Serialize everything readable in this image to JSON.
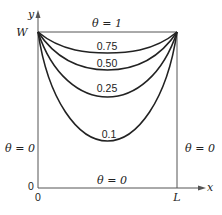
{
  "diagram": {
    "axes": {
      "x_label": "x",
      "y_label": "y",
      "origin_x_label": "0",
      "origin_y_label": "0",
      "x_end_label": "L",
      "y_top_label": "W"
    },
    "boundary_conditions": {
      "top": "θ = 1",
      "bottom": "θ = 0",
      "left": "θ = 0",
      "right": "θ = 0"
    },
    "isotherms": [
      {
        "value": "0.75",
        "min_y_px": 53
      },
      {
        "value": "0.50",
        "min_y_px": 70
      },
      {
        "value": "0.25",
        "min_y_px": 97
      },
      {
        "value": "0.1",
        "min_y_px": 141
      }
    ],
    "colors": {
      "line": "#222222",
      "axis": "#555555",
      "background": "#ffffff"
    }
  }
}
